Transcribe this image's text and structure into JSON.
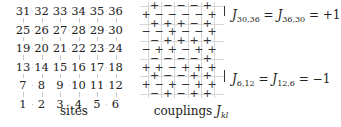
{
  "sites": {
    "rows": [
      [
        "31",
        "32",
        "33",
        "34",
        "35",
        "36"
      ],
      [
        "25",
        "26",
        "27",
        "28",
        "29",
        "30"
      ],
      [
        "19",
        "20",
        "21",
        "22",
        "23",
        "24"
      ],
      [
        "13",
        "14",
        "15",
        "16",
        "17",
        "18"
      ],
      [
        "7",
        "8",
        "9",
        "10",
        "11",
        "12"
      ],
      [
        "1",
        "2",
        "3",
        "4",
        "5",
        "6"
      ]
    ],
    "caption": "sites"
  },
  "couplings": {
    "rows": [
      {
        "type": "h",
        "signs": [
          "+",
          "−",
          "−",
          "−",
          "+"
        ]
      },
      {
        "type": "v",
        "signs": [
          "+",
          "−",
          "−",
          "−",
          "−",
          "+"
        ]
      },
      {
        "type": "h",
        "signs": [
          "+",
          "+",
          "+",
          "−",
          "+"
        ]
      },
      {
        "type": "v",
        "signs": [
          "−",
          "−",
          "+",
          "−",
          "−",
          "+"
        ]
      },
      {
        "type": "h",
        "signs": [
          "−",
          "+",
          "+",
          "+",
          "+"
        ]
      },
      {
        "type": "v",
        "signs": [
          "−",
          "+",
          "+",
          "−",
          "+",
          "+"
        ]
      },
      {
        "type": "h",
        "signs": [
          "−",
          "−",
          "−",
          "−",
          "+"
        ]
      },
      {
        "type": "v",
        "signs": [
          "+",
          "+",
          "−",
          "+",
          "+",
          "+"
        ]
      },
      {
        "type": "h",
        "signs": [
          "+",
          "−",
          "−",
          "+",
          "+"
        ]
      },
      {
        "type": "v",
        "signs": [
          "+",
          "−",
          "+",
          "−",
          "+",
          "+"
        ]
      },
      {
        "type": "h",
        "signs": [
          "−",
          "+",
          "−",
          "+",
          "+"
        ]
      }
    ],
    "caption_text": "couplings ",
    "caption_symbol": "J",
    "caption_sub": "kl"
  },
  "annotations": {
    "top": {
      "J": "J",
      "sub1": "30,36",
      "eq1": " = ",
      "J2": "J",
      "sub2": "36,30",
      "eq2": " = +1"
    },
    "bottom": {
      "J": "J",
      "sub1": "6,12",
      "eq1": " = ",
      "J2": "J",
      "sub2": "12,6",
      "eq2": " = −1"
    }
  }
}
